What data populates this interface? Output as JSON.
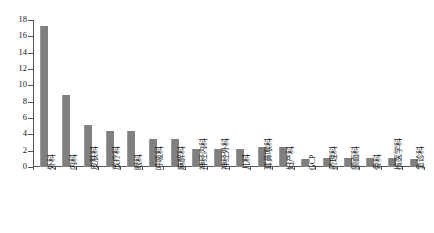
{
  "chart_data": {
    "type": "bar",
    "title": "",
    "subtitle": "",
    "xlabel": "",
    "ylabel": "",
    "ylim": [
      0,
      18
    ],
    "yticks": [
      0,
      2,
      4,
      6,
      8,
      10,
      12,
      14,
      16,
      18
    ],
    "grid": false,
    "legend": false,
    "legend_position": "none",
    "bar_color": "#808080",
    "axis_color": "#555555",
    "categories": [
      "外科",
      "内科",
      "皮肤科",
      "放疗科",
      "眼科",
      "呼吸科",
      "麻醉科",
      "神经内科",
      "神经外科",
      "儿科",
      "耳鼻喉科",
      "妇产科",
      "GCP",
      "药理科",
      "颌面科",
      "骨科",
      "核医学科",
      "急诊科"
    ],
    "values": [
      17.3,
      8.8,
      5.2,
      4.4,
      4.4,
      3.4,
      3.4,
      2.2,
      2.2,
      2.2,
      2.4,
      2.4,
      1.0,
      1.1,
      1.1,
      1.1,
      1.1,
      1.0
    ]
  }
}
